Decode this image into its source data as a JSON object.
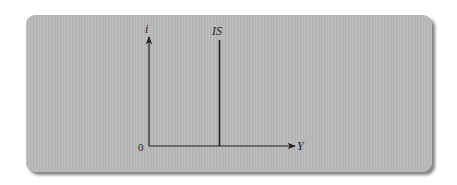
{
  "diagram": {
    "type": "IS curve (vertical)",
    "axes": {
      "y_label": "i",
      "x_label": "Y",
      "origin_label": "0"
    },
    "curves": [
      {
        "label": "IS",
        "orientation": "vertical"
      }
    ],
    "colors": {
      "panel_background": "#b9b9b9",
      "line": "#1f1f1f",
      "page_background": "#ffffff"
    }
  }
}
